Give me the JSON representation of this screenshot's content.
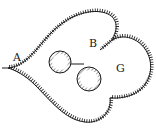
{
  "diagram": {
    "labels": {
      "a": "A",
      "b": "B",
      "g": "G"
    },
    "colors": {
      "stroke": "#1a1a1a",
      "background": "#ffffff"
    }
  }
}
